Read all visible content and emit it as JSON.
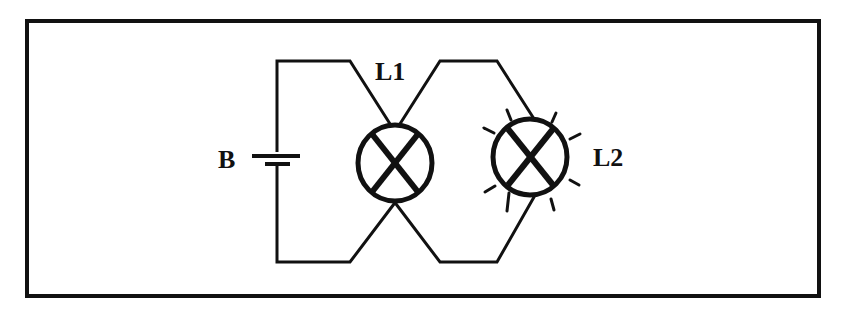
{
  "diagram": {
    "type": "circuit",
    "components": {
      "battery": {
        "label": "B"
      },
      "lamp1": {
        "label": "L1",
        "state": "off"
      },
      "lamp2": {
        "label": "L2",
        "state": "lit"
      }
    },
    "colors": {
      "line": "#111111",
      "background": "#ffffff"
    }
  }
}
